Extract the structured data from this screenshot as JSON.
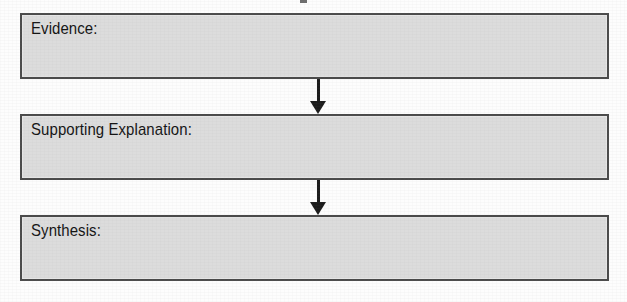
{
  "organizer": {
    "fields": [
      {
        "id": "evidence",
        "label": "Evidence:",
        "value": ""
      },
      {
        "id": "supporting-explanation",
        "label": "Supporting Explanation:",
        "value": ""
      },
      {
        "id": "synthesis",
        "label": "Synthesis:",
        "value": ""
      }
    ],
    "connectors": [
      {
        "id": "evidence-to-supporting-explanation",
        "direction": "down"
      },
      {
        "id": "supporting-explanation-to-synthesis",
        "direction": "down"
      }
    ],
    "colors": {
      "box_fill": "#dcdcdc",
      "box_border": "#4a4a4a",
      "arrow": "#1c1c1c",
      "text": "#141414",
      "background": "#fdfdfd"
    }
  }
}
